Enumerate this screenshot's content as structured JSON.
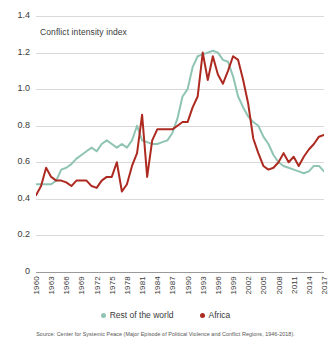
{
  "chart_data": {
    "type": "line",
    "title": "Conflict intensity index",
    "xlabel": "",
    "ylabel": "",
    "ylim": [
      0,
      1.4
    ],
    "xlim": [
      1960,
      2017
    ],
    "yticks": [
      "0",
      "0.2",
      "0.4",
      "0.6",
      "0.8",
      "1.0",
      "1.2",
      "1.4"
    ],
    "ytick_values": [
      0,
      0.2,
      0.4,
      0.6,
      0.8,
      1.0,
      1.2,
      1.4
    ],
    "xticks": [
      "1960",
      "1963",
      "1966",
      "1969",
      "1972",
      "1975",
      "1978",
      "1981",
      "1984",
      "1987",
      "1990",
      "1993",
      "1996",
      "1999",
      "2002",
      "2005",
      "2008",
      "2011",
      "2014",
      "2017"
    ],
    "grid": true,
    "legend_position": "bottom",
    "x": [
      1960,
      1961,
      1962,
      1963,
      1964,
      1965,
      1966,
      1967,
      1968,
      1969,
      1970,
      1971,
      1972,
      1973,
      1974,
      1975,
      1976,
      1977,
      1978,
      1979,
      1980,
      1981,
      1982,
      1983,
      1984,
      1985,
      1986,
      1987,
      1988,
      1989,
      1990,
      1991,
      1992,
      1993,
      1994,
      1995,
      1996,
      1997,
      1998,
      1999,
      2000,
      2001,
      2002,
      2003,
      2004,
      2005,
      2006,
      2007,
      2008,
      2009,
      2010,
      2011,
      2012,
      2013,
      2014,
      2015,
      2016,
      2017
    ],
    "series": [
      {
        "name": "Rest of the world",
        "color": "#8fc4b5",
        "values": [
          0.48,
          0.48,
          0.48,
          0.48,
          0.5,
          0.56,
          0.57,
          0.59,
          0.62,
          0.64,
          0.66,
          0.68,
          0.66,
          0.7,
          0.72,
          0.7,
          0.68,
          0.7,
          0.68,
          0.72,
          0.8,
          0.72,
          0.71,
          0.7,
          0.7,
          0.71,
          0.72,
          0.76,
          0.84,
          0.96,
          1.0,
          1.12,
          1.18,
          1.19,
          1.2,
          1.21,
          1.2,
          1.16,
          1.15,
          1.07,
          0.96,
          0.9,
          0.85,
          0.82,
          0.8,
          0.74,
          0.7,
          0.64,
          0.6,
          0.58,
          0.57,
          0.56,
          0.55,
          0.54,
          0.55,
          0.58,
          0.58,
          0.55
        ]
      },
      {
        "name": "Africa",
        "color": "#ad2a21",
        "values": [
          0.42,
          0.47,
          0.57,
          0.52,
          0.5,
          0.5,
          0.49,
          0.47,
          0.5,
          0.5,
          0.5,
          0.47,
          0.46,
          0.5,
          0.52,
          0.52,
          0.6,
          0.44,
          0.48,
          0.58,
          0.65,
          0.86,
          0.52,
          0.72,
          0.78,
          0.78,
          0.78,
          0.78,
          0.8,
          0.82,
          0.82,
          0.9,
          0.96,
          1.2,
          1.05,
          1.18,
          1.08,
          1.03,
          1.1,
          1.18,
          1.16,
          1.05,
          0.92,
          0.73,
          0.65,
          0.58,
          0.56,
          0.57,
          0.6,
          0.65,
          0.6,
          0.63,
          0.58,
          0.63,
          0.67,
          0.7,
          0.74,
          0.75
        ]
      }
    ],
    "source": "Source: Center for Systemic Peace (Major Episode of Political Violence and Conflict Regions, 1946-2018)."
  }
}
